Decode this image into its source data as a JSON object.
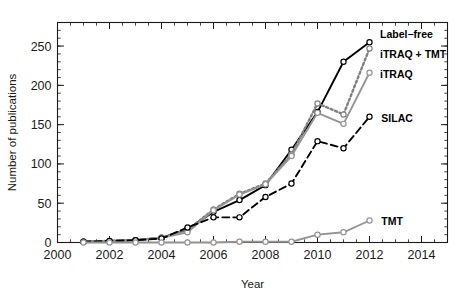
{
  "figure": {
    "background": "#ffffff",
    "has_title": false
  },
  "chart_data": {
    "type": "line",
    "title": "",
    "subtitle": "",
    "xlabel": "Year",
    "ylabel": "Number of publications",
    "xlim": [
      2000,
      2015
    ],
    "ylim": [
      0,
      280
    ],
    "xticks": [
      2000,
      2002,
      2004,
      2006,
      2008,
      2010,
      2012,
      2014
    ],
    "xtick_labels": [
      "2000",
      "2002",
      "2004",
      "2006",
      "2008",
      "2010",
      "2012",
      "2014"
    ],
    "x_minor_step": 0.5,
    "yticks": [
      0,
      50,
      100,
      150,
      200,
      250
    ],
    "ytick_labels": [
      "0",
      "50",
      "100",
      "150",
      "200",
      "250"
    ],
    "y_minor_step": 10,
    "grid": false,
    "legend_position": "inline-right-of-line-ends",
    "x": [
      2001,
      2002,
      2003,
      2004,
      2005,
      2006,
      2007,
      2008,
      2009,
      2010,
      2011,
      2012
    ],
    "series": [
      {
        "name": "Label-free",
        "label": "Label−free",
        "color": "#000000",
        "line_style": "solid",
        "marker": "circle",
        "values": [
          1,
          2,
          3,
          6,
          17,
          39,
          54,
          73,
          118,
          166,
          230,
          255
        ],
        "label_x": 2012.25,
        "label_y": 266
      },
      {
        "name": "iTRAQ + TMT",
        "label": "iTRAQ + TMT",
        "color": "#808080",
        "line_style": "dotted",
        "marker": "circle",
        "values": [
          1,
          2,
          3,
          6,
          16,
          42,
          62,
          75,
          112,
          177,
          163,
          247
        ],
        "label_x": 2012.25,
        "label_y": 240
      },
      {
        "name": "iTRAQ",
        "label": "iTRAQ",
        "color": "#949494",
        "line_style": "solid",
        "marker": "circle",
        "values": [
          1,
          2,
          3,
          6,
          13,
          41,
          61,
          74,
          110,
          165,
          151,
          216
        ],
        "label_x": 2012.25,
        "label_y": 214
      },
      {
        "name": "SILAC",
        "label": "SILAC",
        "color": "#000000",
        "line_style": "dashed",
        "marker": "circle",
        "values": [
          1,
          2,
          3,
          5,
          19,
          32,
          32,
          58,
          75,
          129,
          120,
          160
        ],
        "label_x": 2012.3,
        "label_y": 159
      },
      {
        "name": "TMT",
        "label": "TMT",
        "color": "#949494",
        "line_style": "solid",
        "marker": "circle",
        "values": [
          0,
          0,
          0,
          0,
          0,
          0,
          1,
          1,
          1,
          10,
          13,
          28
        ],
        "label_x": 2012.3,
        "label_y": 27
      }
    ]
  }
}
